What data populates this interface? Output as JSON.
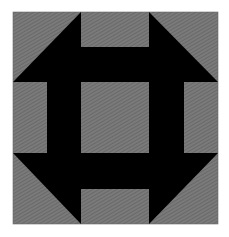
{
  "figure": {
    "colors": {
      "background": "#ffffff",
      "fabric_light": "#7a7a7a",
      "fabric_hatch": "#5e5e5e",
      "fabric_dark": "#000000",
      "border": "#6a6a6a"
    },
    "block": {
      "x": 13,
      "y": 12,
      "width": 205,
      "height": 212
    }
  }
}
